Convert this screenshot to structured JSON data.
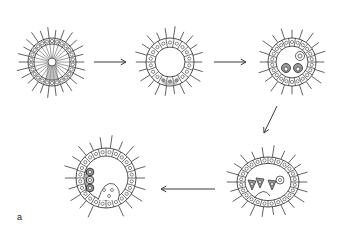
{
  "figure": {
    "panel_label": "a",
    "colors": {
      "line": "#3a3a3a",
      "background": "#ffffff",
      "shade": "#9a9a9a",
      "dark_cell": "#555555"
    },
    "stages": [
      {
        "id": "stage-1",
        "description": "blastula with radial cells, central cavity and shaded posterior pole",
        "cx": 52,
        "cy": 62,
        "rx": 24,
        "ry": 24,
        "type": "radial"
      },
      {
        "id": "stage-2",
        "description": "ring of epithelial cells with hollow blastocoel and shaded ingressing region at bottom",
        "cx": 170,
        "cy": 62,
        "rx": 24,
        "ry": 24,
        "type": "ring-shaded"
      },
      {
        "id": "stage-3",
        "description": "ring of epithelial cells with two dark cells and one light cell inside cavity",
        "cx": 292,
        "cy": 62,
        "rx": 24,
        "ry": 24,
        "type": "ring-inner"
      },
      {
        "id": "stage-4",
        "description": "flattened ring with invaginating base and three dark triangular cells inside",
        "cx": 268,
        "cy": 182,
        "rx": 31,
        "ry": 25,
        "type": "invaginating"
      },
      {
        "id": "stage-5",
        "description": "horseshoe-shaped embryo with deep invagination and stack of three dark cells at left",
        "cx": 106,
        "cy": 178,
        "rx": 30,
        "ry": 30,
        "type": "horseshoe"
      }
    ],
    "arrows": [
      {
        "id": "arrow-1-2",
        "x1": 94,
        "y1": 62,
        "x2": 126,
        "y2": 62
      },
      {
        "id": "arrow-2-3",
        "x1": 214,
        "y1": 62,
        "x2": 246,
        "y2": 62
      },
      {
        "id": "arrow-3-4",
        "x1": 277,
        "y1": 106,
        "x2": 264,
        "y2": 133
      },
      {
        "id": "arrow-4-5",
        "x1": 215,
        "y1": 189,
        "x2": 161,
        "y2": 189
      }
    ]
  }
}
